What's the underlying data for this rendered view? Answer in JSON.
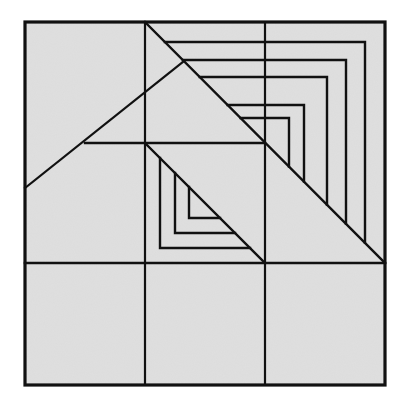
{
  "figure": {
    "title": "",
    "fill_color": "#dcdcdc",
    "line_color": "#111111",
    "background_color": "#ffffff"
  },
  "geometry": {
    "outer_square": {
      "x1": 25,
      "y1": 22,
      "x2": 385,
      "y2": 385
    },
    "grid_vertical_x": [
      145,
      265
    ],
    "grid_horizontal_y": [
      263
    ],
    "partial_horizontal": {
      "x1": 85,
      "x2": 265,
      "y": 143
    },
    "partial_vertical": {
      "x": 145,
      "y1": 22,
      "y2": 385
    },
    "big_diagonal": {
      "x1": 145,
      "y1": 22,
      "x2": 385,
      "y2": 263
    },
    "center_diagonal": {
      "x1": 145,
      "y1": 143,
      "x2": 265,
      "y2": 263
    },
    "left_diagonal": {
      "x1": 25,
      "y1": 188,
      "x2": 184,
      "y2": 61
    },
    "top_right_nested_L": [
      {
        "x": 365,
        "top_y": 42,
        "left_x": 165
      },
      {
        "x": 346,
        "top_y": 60,
        "left_x": 183
      },
      {
        "x": 327,
        "top_y": 77,
        "left_x": 200
      },
      {
        "x": 304,
        "top_y": 105,
        "left_x": 228
      },
      {
        "x": 289,
        "top_y": 118,
        "left_x": 241
      }
    ],
    "center_nested_L": [
      {
        "x": 160,
        "bottom_y": 248,
        "right_x": 250
      },
      {
        "x": 175,
        "bottom_y": 233,
        "right_x": 235
      },
      {
        "x": 189,
        "bottom_y": 218,
        "right_x": 220
      }
    ]
  }
}
